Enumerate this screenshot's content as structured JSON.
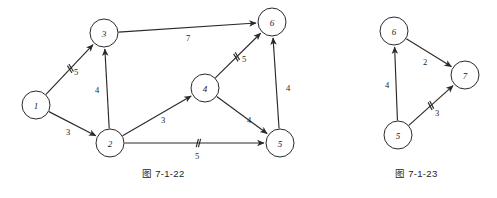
{
  "figures": [
    {
      "id": "fig-7-1-22",
      "caption": "图 7-1-22",
      "caption_pos": {
        "x": 142,
        "y": 166
      },
      "nodes": [
        {
          "label": "1",
          "x": 36,
          "y": 105,
          "r": 14
        },
        {
          "label": "2",
          "x": 110,
          "y": 143,
          "r": 14
        },
        {
          "label": "3",
          "x": 104,
          "y": 33,
          "r": 14
        },
        {
          "label": "4",
          "x": 205,
          "y": 88,
          "r": 14
        },
        {
          "label": "5",
          "x": 280,
          "y": 143,
          "r": 14
        },
        {
          "label": "6",
          "x": 272,
          "y": 22,
          "r": 14
        }
      ],
      "edges": [
        {
          "from": "1",
          "to": "3",
          "weight": "5",
          "wx": 76,
          "wy": 72,
          "ticks": 2,
          "tick_at": 0.52
        },
        {
          "from": "1",
          "to": "2",
          "weight": "3",
          "wx": 68,
          "wy": 132,
          "ticks": 0,
          "tick_at": 0.5
        },
        {
          "from": "2",
          "to": "3",
          "weight": "4",
          "wx": 97,
          "wy": 90,
          "ticks": 0,
          "tick_at": 0.5
        },
        {
          "from": "3",
          "to": "6",
          "weight": "7",
          "wx": 188,
          "wy": 38,
          "ticks": 0,
          "tick_at": 0.5
        },
        {
          "from": "2",
          "to": "4",
          "weight": "3",
          "wx": 163,
          "wy": 120,
          "ticks": 0,
          "tick_at": 0.5
        },
        {
          "from": "2",
          "to": "5",
          "weight": "5",
          "wx": 197,
          "wy": 156,
          "ticks": 2,
          "tick_at": 0.53
        },
        {
          "from": "4",
          "to": "6",
          "weight": "5",
          "wx": 244,
          "wy": 59,
          "ticks": 2,
          "tick_at": 0.47
        },
        {
          "from": "4",
          "to": "5",
          "weight": "4",
          "wx": 249,
          "wy": 120,
          "ticks": 0,
          "tick_at": 0.5
        },
        {
          "from": "5",
          "to": "6",
          "weight": "4",
          "wx": 288,
          "wy": 88,
          "ticks": 0,
          "tick_at": 0.5
        }
      ]
    },
    {
      "id": "fig-7-1-23",
      "caption": "图 7-1-23",
      "caption_pos": {
        "x": 395,
        "y": 166
      },
      "nodes": [
        {
          "label": "6",
          "x": 394,
          "y": 31,
          "r": 14
        },
        {
          "label": "7",
          "x": 465,
          "y": 75,
          "r": 14
        },
        {
          "label": "5",
          "x": 398,
          "y": 135,
          "r": 14
        }
      ],
      "edges": [
        {
          "from": "6",
          "to": "7",
          "weight": "2",
          "wx": 425,
          "wy": 62,
          "ticks": 0,
          "tick_at": 0.5
        },
        {
          "from": "5",
          "to": "6",
          "weight": "4",
          "wx": 387,
          "wy": 85,
          "ticks": 0,
          "tick_at": 0.5
        },
        {
          "from": "5",
          "to": "7",
          "weight": "3",
          "wx": 437,
          "wy": 113,
          "ticks": 2,
          "tick_at": 0.5
        }
      ]
    }
  ],
  "colors": {
    "ink": "#2a2a2a",
    "background": "#ffffff"
  }
}
